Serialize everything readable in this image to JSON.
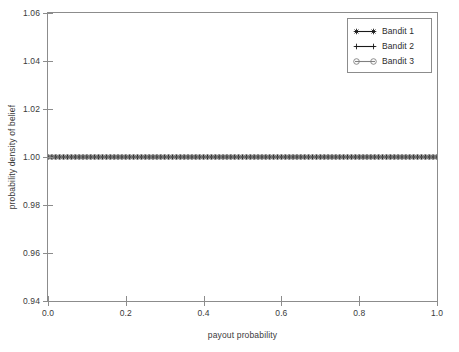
{
  "chart_data": {
    "type": "line",
    "title": "",
    "xlabel": "payout probability",
    "ylabel": "probability density of belief",
    "xlim": [
      0.0,
      1.0
    ],
    "ylim": [
      0.94,
      1.06
    ],
    "xticks": [
      "0.0",
      "0.2",
      "0.4",
      "0.6",
      "0.8",
      "1.0"
    ],
    "xtick_values": [
      0.0,
      0.2,
      0.4,
      0.6,
      0.8,
      1.0
    ],
    "yticks": [
      "0.94",
      "0.96",
      "0.98",
      "1.00",
      "1.02",
      "1.04",
      "1.06"
    ],
    "ytick_values": [
      0.94,
      0.96,
      0.98,
      1.0,
      1.02,
      1.04,
      1.06
    ],
    "grid": false,
    "legend_position": "upper right",
    "x": [
      0.0,
      0.01,
      0.02,
      0.03,
      0.04,
      0.05,
      0.06,
      0.07,
      0.08,
      0.09,
      0.1,
      0.11,
      0.12,
      0.13,
      0.14,
      0.15,
      0.16,
      0.17,
      0.18,
      0.19,
      0.2,
      0.21,
      0.22,
      0.23,
      0.24,
      0.25,
      0.26,
      0.27,
      0.28,
      0.29,
      0.3,
      0.31,
      0.32,
      0.33,
      0.34,
      0.35,
      0.36,
      0.37,
      0.38,
      0.39,
      0.4,
      0.41,
      0.42,
      0.43,
      0.44,
      0.45,
      0.46,
      0.47,
      0.48,
      0.49,
      0.5,
      0.51,
      0.52,
      0.53,
      0.54,
      0.55,
      0.56,
      0.57,
      0.58,
      0.59,
      0.6,
      0.61,
      0.62,
      0.63,
      0.64,
      0.65,
      0.66,
      0.67,
      0.68,
      0.69,
      0.7,
      0.71,
      0.72,
      0.73,
      0.74,
      0.75,
      0.76,
      0.77,
      0.78,
      0.79,
      0.8,
      0.81,
      0.82,
      0.83,
      0.84,
      0.85,
      0.86,
      0.87,
      0.88,
      0.89,
      0.9,
      0.91,
      0.92,
      0.93,
      0.94,
      0.95,
      0.96,
      0.97,
      0.98,
      0.99,
      1.0
    ],
    "series": [
      {
        "name": "Bandit 1",
        "marker": "star",
        "color": "#1a1a1a",
        "constant_value": 1.0
      },
      {
        "name": "Bandit 2",
        "marker": "plus",
        "color": "#1a1a1a",
        "constant_value": 1.0
      },
      {
        "name": "Bandit 3",
        "marker": "circle",
        "color": "#808080",
        "constant_value": 1.0
      }
    ],
    "legend": [
      "Bandit 1",
      "Bandit 2",
      "Bandit 3"
    ],
    "annotations": []
  },
  "axes": {
    "x_title": "payout probability",
    "y_title": "probability density of belief"
  },
  "colors": {
    "frame": "#8c8c8c",
    "text": "#3a3a3a",
    "background": "#ffffff",
    "series_dark": "#1a1a1a",
    "series_gray": "#808080"
  }
}
